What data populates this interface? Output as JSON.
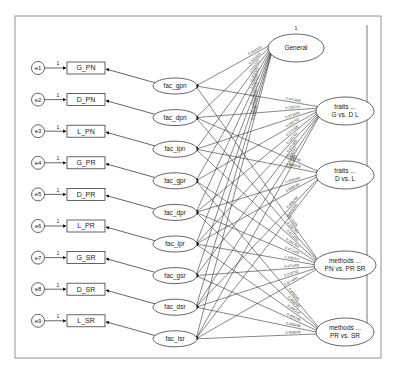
{
  "frame": {
    "x": 15,
    "y": 16,
    "w": 366,
    "h": 342,
    "right_rule_x": 367
  },
  "errors": [
    {
      "id": "e1",
      "label": "e1",
      "fixed": "1"
    },
    {
      "id": "e2",
      "label": "e2",
      "fixed": "1"
    },
    {
      "id": "e3",
      "label": "e3",
      "fixed": "1"
    },
    {
      "id": "e4",
      "label": "e4",
      "fixed": "1"
    },
    {
      "id": "e5",
      "label": "e5",
      "fixed": "1"
    },
    {
      "id": "e6",
      "label": "e6",
      "fixed": "1"
    },
    {
      "id": "e7",
      "label": "e7",
      "fixed": "1"
    },
    {
      "id": "e8",
      "label": "e8",
      "fixed": "1"
    },
    {
      "id": "e9",
      "label": "e9",
      "fixed": "1"
    }
  ],
  "observed": [
    {
      "id": "G_PN",
      "label": "G_PN"
    },
    {
      "id": "D_PN",
      "label": "D_PN"
    },
    {
      "id": "L_PN",
      "label": "L_PN"
    },
    {
      "id": "G_PR",
      "label": "G_PR"
    },
    {
      "id": "D_PR",
      "label": "D_PR"
    },
    {
      "id": "L_PR",
      "label": "L_PR"
    },
    {
      "id": "G_SR",
      "label": "G_SR"
    },
    {
      "id": "D_SR",
      "label": "D_SR"
    },
    {
      "id": "L_SR",
      "label": "L_SR"
    }
  ],
  "factors": [
    {
      "id": "fac_gpn",
      "label": "fac_gpn"
    },
    {
      "id": "fac_dpn",
      "label": "fac_dpn"
    },
    {
      "id": "fac_lpn",
      "label": "fac_lpn"
    },
    {
      "id": "fac_gpr",
      "label": "fac_gpr"
    },
    {
      "id": "fac_dpr",
      "label": "fac_dpr"
    },
    {
      "id": "fac_lpr",
      "label": "fac_lpr"
    },
    {
      "id": "fac_gsr",
      "label": "fac_gsr"
    },
    {
      "id": "fac_dsr",
      "label": "fac_dsr"
    },
    {
      "id": "fac_lsr",
      "label": "fac_lsr"
    }
  ],
  "contrasts": [
    {
      "id": "general",
      "line1": "General",
      "line2": "",
      "variance_label": "1"
    },
    {
      "id": "traits_gdl",
      "line1": "traits ...",
      "line2": "G vs. D L",
      "variance_label": ""
    },
    {
      "id": "traits_dl",
      "line1": "traits ...",
      "line2": "D vs. L",
      "variance_label": ""
    },
    {
      "id": "methods_pn",
      "line1": "methods ...",
      "line2": "PN vs. PR SR",
      "variance_label": ""
    },
    {
      "id": "methods_prsr",
      "line1": "methods ...",
      "line2": "PR vs. SR",
      "variance_label": ""
    }
  ],
  "path_label_values": {
    "note": "approximate; labels too small to read per-path",
    "general": "0.333333",
    "traits_gdl": [
      "0.471405",
      "0.235702"
    ],
    "traits_dl": [
      "0.408248"
    ],
    "methods_pn": [
      "0.471405",
      "0.235702"
    ],
    "methods_prsr": [
      "0.408248"
    ]
  }
}
